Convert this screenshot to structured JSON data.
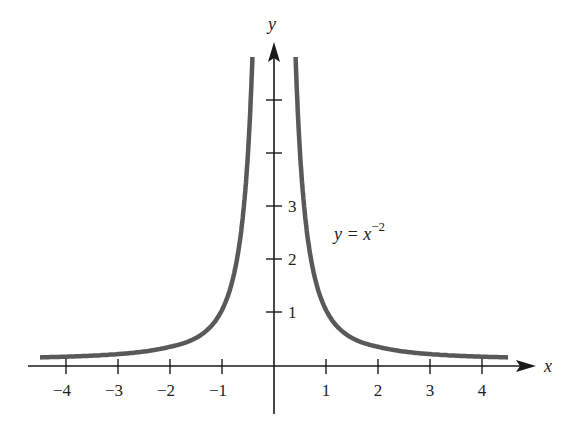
{
  "chart_data": {
    "type": "line",
    "title": "",
    "xlabel": "x",
    "ylabel": "y",
    "annotation": {
      "base": "y = x",
      "exponent": "−2"
    },
    "x_ticks": [
      "−4",
      "−3",
      "−2",
      "−1",
      "1",
      "2",
      "3",
      "4"
    ],
    "y_ticks": [
      "1",
      "2",
      "3",
      "",
      ""
    ],
    "xlim": [
      -4.5,
      4.5
    ],
    "ylim": [
      0,
      6
    ],
    "grid": false,
    "series": [
      {
        "name": "y = x^-2 (x<0)",
        "x": [
          -4.5,
          -4,
          -3,
          -2,
          -1,
          -0.75,
          -0.5,
          -0.42
        ],
        "y": [
          0.049,
          0.0625,
          0.111,
          0.25,
          1,
          1.778,
          4,
          5.67
        ]
      },
      {
        "name": "y = x^-2 (x>0)",
        "x": [
          0.42,
          0.5,
          0.75,
          1,
          2,
          3,
          4,
          4.5
        ],
        "y": [
          5.67,
          4,
          1.778,
          1,
          0.25,
          0.111,
          0.0625,
          0.049
        ]
      }
    ],
    "colors": {
      "curve": "#595959",
      "axis": "#1a1a1a"
    }
  }
}
